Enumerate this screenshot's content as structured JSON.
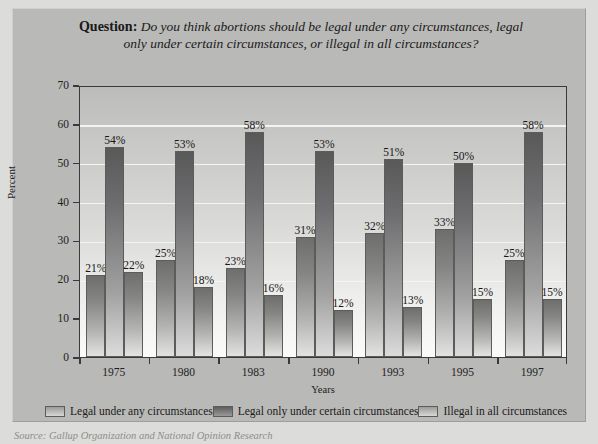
{
  "figure": {
    "title_label": "Question:",
    "title_line1": "Do you think abortions should be legal under any circumstances, legal",
    "title_line2": "only under certain circumstances, or illegal in all circumstances?",
    "source": "Source: Gallup Organization and National Opinion Research"
  },
  "chart_data": {
    "type": "bar",
    "title": "Question: Do you think abortions should be legal under any circumstances, legal only under certain circumstances, or illegal in all circumstances?",
    "xlabel": "Years",
    "ylabel": "Percent",
    "ylim": [
      0,
      70
    ],
    "yticks": [
      0,
      10,
      20,
      30,
      40,
      50,
      60,
      70
    ],
    "grid": true,
    "legend_position": "bottom",
    "categories": [
      "1975",
      "1980",
      "1983",
      "1990",
      "1993",
      "1995",
      "1997"
    ],
    "series": [
      {
        "name": "Legal under any circumstances",
        "values": [
          21,
          25,
          23,
          31,
          32,
          33,
          25
        ],
        "labels": [
          "21%",
          "25%",
          "23%",
          "31%",
          "32%",
          "33%",
          "25%"
        ]
      },
      {
        "name": "Legal only under certain circumstances",
        "values": [
          54,
          53,
          58,
          53,
          51,
          50,
          58
        ],
        "labels": [
          "54%",
          "53%",
          "58%",
          "53%",
          "51%",
          "50%",
          "58%"
        ]
      },
      {
        "name": "Illegal in all circumstances",
        "values": [
          22,
          18,
          16,
          12,
          13,
          15,
          15
        ],
        "labels": [
          "22%",
          "18%",
          "16%",
          "12%",
          "13%",
          "15%",
          "15%"
        ]
      }
    ]
  }
}
